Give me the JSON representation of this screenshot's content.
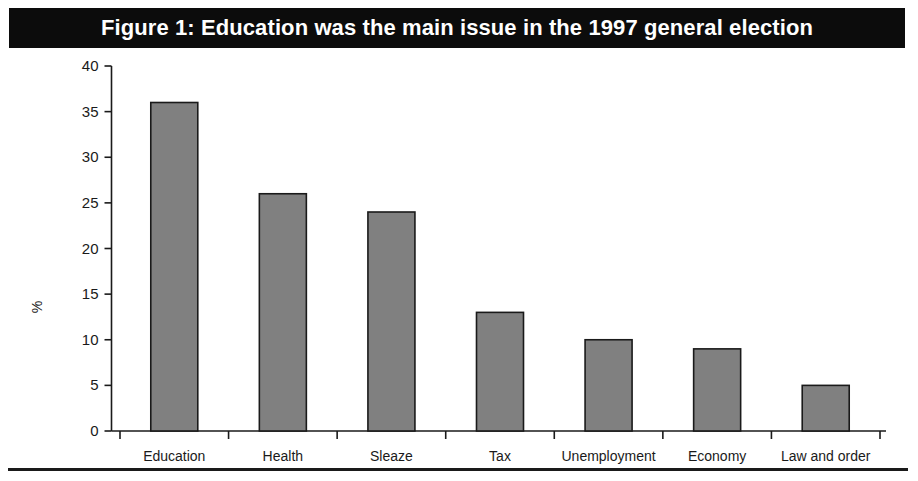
{
  "figure": {
    "title": "Figure 1: Education was the main issue in the 1997 general election",
    "title_background": "#0c0c0c",
    "title_color": "#ffffff",
    "background": "#ffffff",
    "rule_color": "#1a1a1a"
  },
  "chart_data": {
    "type": "bar",
    "title": "Figure 1: Education was the main issue in the 1997 general election",
    "subtitle": "",
    "xlabel": "",
    "ylabel": "%",
    "categories": [
      "Education",
      "Health",
      "Sleaze",
      "Tax",
      "Unemployment",
      "Economy",
      "Law and order"
    ],
    "values": [
      36,
      26,
      24,
      13,
      10,
      9,
      5
    ],
    "ylim": [
      0,
      40
    ],
    "yticks": [
      0,
      5,
      10,
      15,
      20,
      25,
      30,
      35,
      40
    ],
    "ytick_labels": [
      "0",
      "5",
      "10",
      "15",
      "20",
      "25",
      "30",
      "35",
      "40"
    ],
    "grid": false,
    "legend": false,
    "legend_position": "none",
    "bar_fill": "#808080",
    "bar_edge": "#1a1a1a",
    "axis_color": "#1a1a1a"
  }
}
